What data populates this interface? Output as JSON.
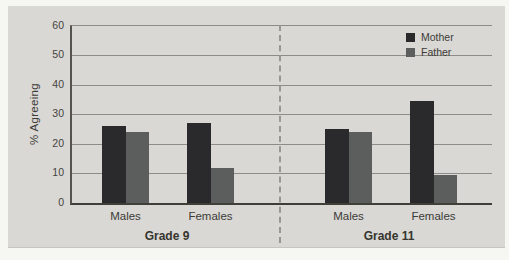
{
  "figure": {
    "page_background": "#f6f6f3",
    "panel_background": "#d9d8d4"
  },
  "chart_data": {
    "type": "bar",
    "title": "",
    "ylabel": "% Agreeing",
    "xlabel": "",
    "ylim": [
      0,
      60
    ],
    "yticks": [
      0,
      10,
      20,
      30,
      40,
      50,
      60
    ],
    "grid": "horizontal",
    "legend_position": "top-right",
    "separator": "dashed vertical line between Grade 9 and Grade 11 groups",
    "series": [
      {
        "name": "Mother",
        "color": "#2a292c"
      },
      {
        "name": "Father",
        "color": "#5c5e5d"
      }
    ],
    "groups": [
      {
        "label": "Grade 9",
        "categories": [
          {
            "label": "Males",
            "values": {
              "Mother": 26,
              "Father": 24
            }
          },
          {
            "label": "Females",
            "values": {
              "Mother": 27,
              "Father": 12
            }
          }
        ]
      },
      {
        "label": "Grade 11",
        "categories": [
          {
            "label": "Males",
            "values": {
              "Mother": 25,
              "Father": 24
            }
          },
          {
            "label": "Females",
            "values": {
              "Mother": 34.5,
              "Father": 9.5
            }
          }
        ]
      }
    ]
  }
}
